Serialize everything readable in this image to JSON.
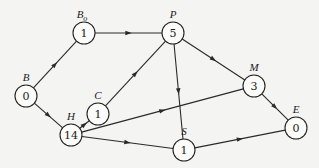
{
  "diagram": {
    "type": "directed-network",
    "nodes": [
      {
        "id": "B",
        "label": "B",
        "sub": "",
        "value": "0",
        "x": 26,
        "y": 96
      },
      {
        "id": "Bo",
        "label": "B",
        "sub": "o",
        "value": "1",
        "x": 84,
        "y": 33
      },
      {
        "id": "P",
        "label": "P",
        "sub": "",
        "value": "5",
        "x": 173,
        "y": 33
      },
      {
        "id": "C",
        "label": "C",
        "sub": "",
        "value": "1",
        "x": 98,
        "y": 114
      },
      {
        "id": "H",
        "label": "H",
        "sub": "",
        "value": "14",
        "x": 71,
        "y": 135
      },
      {
        "id": "M",
        "label": "M",
        "sub": "",
        "value": "3",
        "x": 254,
        "y": 86
      },
      {
        "id": "S",
        "label": "S",
        "sub": "",
        "value": "1",
        "x": 184,
        "y": 150
      },
      {
        "id": "E",
        "label": "E",
        "sub": "",
        "value": "0",
        "x": 296,
        "y": 128
      }
    ],
    "edges": [
      {
        "from": "B",
        "to": "Bo"
      },
      {
        "from": "B",
        "to": "H"
      },
      {
        "from": "Bo",
        "to": "P"
      },
      {
        "from": "C",
        "to": "P"
      },
      {
        "from": "H",
        "to": "C"
      },
      {
        "from": "H",
        "to": "M"
      },
      {
        "from": "H",
        "to": "S"
      },
      {
        "from": "P",
        "to": "M"
      },
      {
        "from": "P",
        "to": "S"
      },
      {
        "from": "M",
        "to": "E"
      },
      {
        "from": "S",
        "to": "E"
      }
    ],
    "style": {
      "node_radius": 11,
      "stroke_color": "#222222",
      "background": "#f4f4f2"
    }
  }
}
